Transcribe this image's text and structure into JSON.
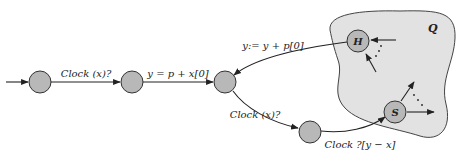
{
  "diagram": {
    "type": "automaton",
    "region": {
      "label": "Q",
      "fill": "#e2e2e2"
    },
    "nodes": [
      {
        "id": "n1",
        "label": ""
      },
      {
        "id": "n2",
        "label": ""
      },
      {
        "id": "n3",
        "label": ""
      },
      {
        "id": "n4",
        "label": ""
      },
      {
        "id": "H",
        "label": "H"
      },
      {
        "id": "S",
        "label": "S"
      }
    ],
    "edges": [
      {
        "from": "start",
        "to": "n1",
        "label": ""
      },
      {
        "from": "n1",
        "to": "n2",
        "label": "Clock (x)?"
      },
      {
        "from": "n2",
        "to": "n3",
        "label": "y = p + x[0]"
      },
      {
        "from": "H",
        "to": "n3",
        "label": "y:= y + p[0]"
      },
      {
        "from": "n3",
        "to": "n4",
        "label": "Clock (x)?"
      },
      {
        "from": "n4",
        "to": "S",
        "label": "Clock ?[y − x]"
      }
    ],
    "ellipsis": "⋰",
    "node_fill": "#b8b8b8"
  }
}
